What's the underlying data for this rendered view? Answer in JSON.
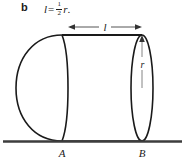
{
  "part": {
    "letter": "b",
    "equation": {
      "lhs": "l",
      "equals": "=",
      "fraction": {
        "numerator": "1",
        "denominator": "2"
      },
      "rhs": "r",
      "period": "."
    },
    "equation_plain": "l = 1/2 r."
  },
  "figure": {
    "type": "solid-of-revolution-diagram",
    "dimension_labels": {
      "length": "l",
      "radius": "r"
    },
    "point_labels": {
      "left": "A",
      "right": "B"
    },
    "colors": {
      "stroke": "#1a1a1a",
      "ground": "#404040",
      "dimension": "#555555",
      "background": "#ffffff"
    },
    "geometry": {
      "ground_line_y": 141,
      "ground_line_x1": 3,
      "ground_line_x2": 182,
      "cylinder_top_y": 35,
      "cylinder_left_x": 62,
      "cylinder_right_x": 142,
      "right_ellipse_cx": 142,
      "right_ellipse_rx": 11,
      "left_ellipse_cx": 62,
      "left_ellipse_rx": 9,
      "hemisphere_left_x": 16,
      "axis_y": 88,
      "dimension_line_y": 27,
      "dimension_x1": 68,
      "dimension_x2": 142
    }
  }
}
